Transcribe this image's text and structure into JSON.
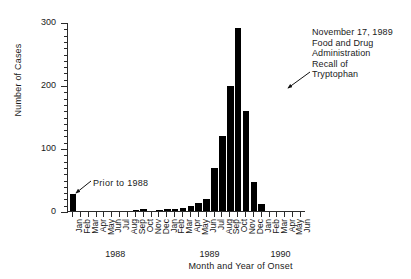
{
  "chart_data": {
    "type": "bar",
    "title": "",
    "xlabel": "Month and Year of Onset",
    "ylabel": "Number of Cases",
    "ylim": [
      0,
      300
    ],
    "yticks": [
      0,
      100,
      200,
      300
    ],
    "ytick_labels": [
      "0",
      "100",
      "200",
      "300"
    ],
    "minor_tick_interval": 10,
    "grid": false,
    "legend": null,
    "bar_color": "#000000",
    "categories": [
      "Jan 1988",
      "Feb 1988",
      "Mar 1988",
      "Apr 1988",
      "May 1988",
      "Jun 1988",
      "Jul 1988",
      "Aug 1988",
      "Sep 1988",
      "Oct 1988",
      "Nov 1988",
      "Dec 1988",
      "Jan 1989",
      "Feb 1989",
      "Mar 1989",
      "Apr 1989",
      "May 1989",
      "Jun 1989",
      "Jul 1989",
      "Aug 1989",
      "Sep 1989",
      "Oct 1989",
      "Nov 1989",
      "Dec 1989",
      "Jan 1990",
      "Feb 1990",
      "Mar 1990",
      "Apr 1990",
      "May 1990",
      "Jun 1990"
    ],
    "month_labels": [
      "Jan",
      "Feb",
      "Mar",
      "Apr",
      "May",
      "Jun",
      "Jul",
      "Aug",
      "Sep",
      "Oct",
      "Nov",
      "Dec",
      "Jan",
      "Feb",
      "Mar",
      "Apr",
      "May",
      "Jun",
      "Jul",
      "Aug",
      "Sep",
      "Oct",
      "Nov",
      "Dec",
      "Jan",
      "Feb",
      "Mar",
      "Apr",
      "May",
      "Jun"
    ],
    "year_groups": [
      {
        "label": "1988",
        "start_index": 0,
        "end_index": 11
      },
      {
        "label": "1989",
        "start_index": 12,
        "end_index": 23
      },
      {
        "label": "1990",
        "start_index": 24,
        "end_index": 29
      }
    ],
    "values": [
      28,
      2,
      2,
      1,
      1,
      0,
      1,
      2,
      3,
      4,
      2,
      3,
      4,
      4,
      6,
      9,
      14,
      21,
      70,
      120,
      200,
      292,
      160,
      48,
      13,
      2,
      1,
      1,
      1,
      0
    ],
    "prior_to_1988_bar_index": 0,
    "peak": {
      "category": "Oct 1989",
      "value": 292
    },
    "annotations": [
      {
        "id": "prior-to-1988",
        "text": "Prior to 1988",
        "points_to_index": 0
      },
      {
        "id": "fda-recall",
        "lines": [
          "November 17, 1989",
          "Food and Drug",
          "Administration",
          "Recall of",
          "Tryptophan"
        ],
        "points_to_index": 22
      }
    ]
  }
}
